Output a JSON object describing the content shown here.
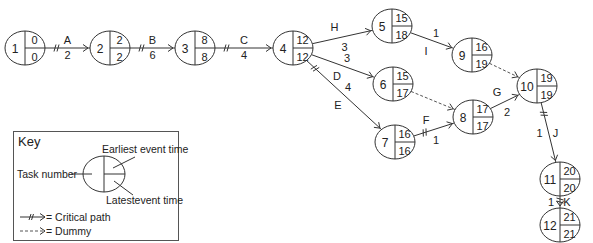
{
  "title_partial": "Activity network",
  "nodes": [
    {
      "id": "1",
      "cx": 25,
      "cy": 48,
      "earliest": "0",
      "latest": "0"
    },
    {
      "id": "2",
      "cx": 110,
      "cy": 48,
      "earliest": "2",
      "latest": "2"
    },
    {
      "id": "3",
      "cx": 195,
      "cy": 48,
      "earliest": "8",
      "latest": "8"
    },
    {
      "id": "4",
      "cx": 293,
      "cy": 48,
      "earliest": "12",
      "latest": "12"
    },
    {
      "id": "5",
      "cx": 392,
      "cy": 26,
      "earliest": "15",
      "latest": "18"
    },
    {
      "id": "6",
      "cx": 393,
      "cy": 84,
      "earliest": "15",
      "latest": "17"
    },
    {
      "id": "7",
      "cx": 395,
      "cy": 142,
      "earliest": "16",
      "latest": "16"
    },
    {
      "id": "8",
      "cx": 473,
      "cy": 117,
      "earliest": "17",
      "latest": "17"
    },
    {
      "id": "9",
      "cx": 472,
      "cy": 55,
      "earliest": "16",
      "latest": "19"
    },
    {
      "id": "10",
      "cx": 537,
      "cy": 86,
      "earliest": "19",
      "latest": "19"
    },
    {
      "id": "11",
      "cx": 560,
      "cy": 179,
      "earliest": "20",
      "latest": "20"
    },
    {
      "id": "12",
      "cx": 560,
      "cy": 225,
      "earliest": "21",
      "latest": "21"
    }
  ],
  "edges": [
    {
      "from": "1",
      "to": "2",
      "label": "A",
      "duration": "2",
      "critical": true,
      "dummy": false
    },
    {
      "from": "2",
      "to": "3",
      "label": "B",
      "duration": "6",
      "critical": true,
      "dummy": false
    },
    {
      "from": "3",
      "to": "4",
      "label": "C",
      "duration": "4",
      "critical": true,
      "dummy": false
    },
    {
      "from": "4",
      "to": "5",
      "label": "H",
      "duration": "3",
      "critical": false,
      "dummy": false
    },
    {
      "from": "4",
      "to": "6",
      "label": "D",
      "duration": "3",
      "critical": false,
      "dummy": false
    },
    {
      "from": "4",
      "to": "7",
      "label": "E",
      "duration": "4",
      "critical": true,
      "dummy": false
    },
    {
      "from": "5",
      "to": "9",
      "label": "I",
      "duration": "1",
      "critical": false,
      "dummy": false
    },
    {
      "from": "6",
      "to": "8",
      "label": "",
      "duration": "",
      "critical": false,
      "dummy": true
    },
    {
      "from": "7",
      "to": "8",
      "label": "F",
      "duration": "1",
      "critical": true,
      "dummy": false
    },
    {
      "from": "8",
      "to": "10",
      "label": "G",
      "duration": "2",
      "critical": false,
      "dummy": false
    },
    {
      "from": "9",
      "to": "10",
      "label": "",
      "duration": "",
      "critical": false,
      "dummy": true
    },
    {
      "from": "10",
      "to": "11",
      "label": "J",
      "duration": "1",
      "critical": true,
      "dummy": false
    },
    {
      "from": "11",
      "to": "12",
      "label": "K",
      "duration": "1",
      "critical": true,
      "dummy": false
    }
  ],
  "key": {
    "title": "Key",
    "task_number": "Task number",
    "earliest_event_time": "Earliest event time",
    "latest_event_time": "Latestevent time",
    "critical_path_label": "= Critical path",
    "dummy_label": "= Dummy"
  },
  "colors": {
    "line": "#333333",
    "text": "#222222",
    "background": "#ffffff"
  }
}
